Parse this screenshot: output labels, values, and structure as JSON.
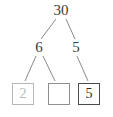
{
  "diagram": {
    "type": "number-bond-factor-tree",
    "root": {
      "label": "30",
      "x": 61,
      "y": 10
    },
    "level2": [
      {
        "label": "6",
        "x": 39,
        "y": 47
      },
      {
        "label": "5",
        "x": 76,
        "y": 47
      }
    ],
    "boxes": [
      {
        "label": "2",
        "x": 23,
        "y": 94,
        "style": "light",
        "filled": true
      },
      {
        "label": "",
        "x": 59,
        "y": 94,
        "style": "mid",
        "filled": false
      },
      {
        "label": "5",
        "x": 89,
        "y": 94,
        "style": "dark",
        "filled": true
      }
    ],
    "edges": [
      {
        "from": "30",
        "to": "6",
        "x1": 56,
        "y1": 19,
        "x2": 41,
        "y2": 39
      },
      {
        "from": "30",
        "to": "5",
        "x1": 66,
        "y1": 19,
        "x2": 75,
        "y2": 39
      },
      {
        "from": "6",
        "to": "box1",
        "x1": 36,
        "y1": 56,
        "x2": 25,
        "y2": 81
      },
      {
        "from": "6",
        "to": "box2",
        "x1": 43,
        "y1": 56,
        "x2": 55,
        "y2": 81
      },
      {
        "from": "5",
        "to": "box3",
        "x1": 77,
        "y1": 56,
        "x2": 88,
        "y2": 81
      }
    ],
    "colors": {
      "stroke": "#8a8a8a",
      "text": "#3a3a3a",
      "ghost_text": "#b9b9b9",
      "box_light_border": "#b6b6b6",
      "box_mid_border": "#8f8f8f",
      "box_dark_border": "#4a4a4a",
      "background": "#ffffff"
    }
  }
}
